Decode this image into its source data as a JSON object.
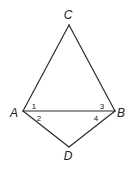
{
  "diagram": {
    "type": "geometry-figure",
    "vertices": [
      {
        "label": "C",
        "x": 69,
        "y": 25,
        "label_x": 68,
        "label_y": 19
      },
      {
        "label": "A",
        "x": 23,
        "y": 111,
        "label_x": 14,
        "label_y": 117
      },
      {
        "label": "B",
        "x": 115,
        "y": 111,
        "label_x": 120,
        "label_y": 117
      },
      {
        "label": "D",
        "x": 69,
        "y": 147,
        "label_x": 68,
        "label_y": 160
      }
    ],
    "segments": [
      {
        "name": "CA",
        "from": "C",
        "to": "A"
      },
      {
        "name": "CB",
        "from": "C",
        "to": "B"
      },
      {
        "name": "AB",
        "from": "A",
        "to": "B"
      },
      {
        "name": "AD",
        "from": "A",
        "to": "D"
      },
      {
        "name": "BD",
        "from": "B",
        "to": "D"
      }
    ],
    "angles": [
      {
        "label": "1",
        "vertex": "A",
        "position": "upper",
        "x": 34,
        "y": 109
      },
      {
        "label": "2",
        "vertex": "A",
        "position": "lower",
        "x": 38,
        "y": 121
      },
      {
        "label": "3",
        "vertex": "B",
        "position": "upper",
        "x": 102,
        "y": 109
      },
      {
        "label": "4",
        "vertex": "B",
        "position": "lower",
        "x": 96,
        "y": 121
      }
    ],
    "stroke_color": "#2a2a2a",
    "text_color": "#222222"
  }
}
